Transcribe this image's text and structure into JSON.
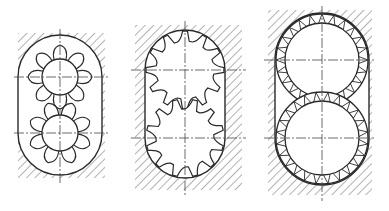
{
  "diagram": {
    "title": "",
    "figures": [
      {
        "id": "fig-lobe-pump",
        "kind": "lobe-rotor-pump",
        "housing": {
          "x": 18,
          "y": 33,
          "w": 87,
          "h": 145,
          "cavity_r": 42
        },
        "axis_x": 60,
        "rotors": [
          {
            "cx": 60,
            "cy": 77,
            "hub_r": 18,
            "tip_r": 32,
            "teeth": 8,
            "phase": 0
          },
          {
            "cx": 60,
            "cy": 133,
            "hub_r": 18,
            "tip_r": 32,
            "teeth": 8,
            "phase": 22.5
          }
        ]
      },
      {
        "id": "fig-spur-gear-pump",
        "kind": "external-spur-gear-pump",
        "housing": {
          "x": 135,
          "y": 25,
          "w": 107,
          "h": 165,
          "cavity_r": 40
        },
        "axis_x": 185,
        "rotors": [
          {
            "cx": 185,
            "cy": 70,
            "root_r": 29,
            "tip_r": 39,
            "teeth": 12,
            "phase": 0
          },
          {
            "cx": 185,
            "cy": 138,
            "root_r": 29,
            "tip_r": 39,
            "teeth": 12,
            "phase": 15
          }
        ]
      },
      {
        "id": "fig-fine-tooth-pump",
        "kind": "fine-tooth-gear-pump",
        "housing": {
          "x": 268,
          "y": 10,
          "w": 104,
          "h": 185,
          "cavity_r": 47
        },
        "axis_x": 322,
        "rotors": [
          {
            "cx": 322,
            "cy": 60,
            "inner_r": 37,
            "tip_r": 46,
            "teeth": 24,
            "phase": 0
          },
          {
            "cx": 322,
            "cy": 138,
            "inner_r": 37,
            "tip_r": 46,
            "teeth": 24,
            "phase": 7.5
          }
        ]
      }
    ],
    "colors": {
      "line": "#2a2a2a",
      "hatch": "#555555",
      "centerline": "#444444",
      "background": "#ffffff"
    }
  }
}
